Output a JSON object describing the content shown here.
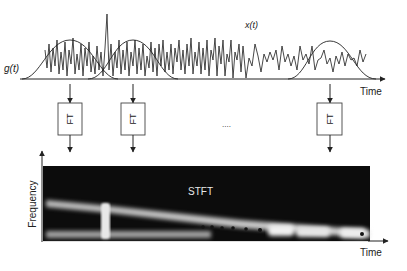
{
  "labels": {
    "window_function": "g(t)",
    "signal": "x(t)",
    "time_top": "Time",
    "time_bottom": "Time",
    "frequency": "Frequency",
    "stft": "STFT",
    "ellipsis": "....",
    "ft_boxes": [
      "FT",
      "FT",
      "FT"
    ]
  },
  "colors": {
    "line": "#2a2a2a",
    "spectrogram_bg": "#0c0c0c",
    "spectrogram_band": "#d8d8d8",
    "background": "#ffffff"
  }
}
